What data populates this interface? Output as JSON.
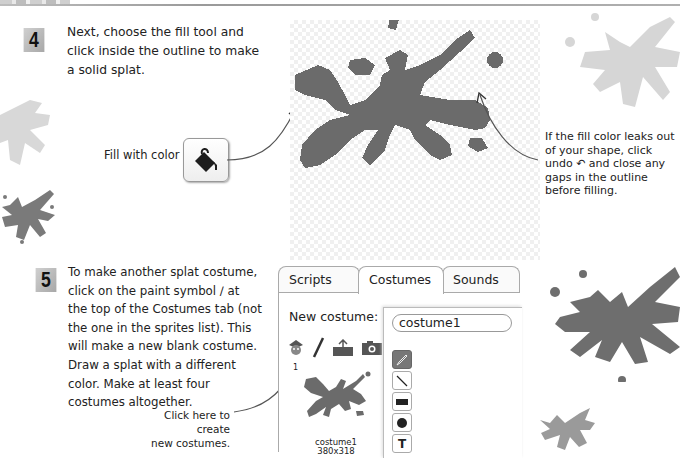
{
  "step4": {
    "number": "4",
    "text_lines": [
      "Next, choose the fill tool and",
      "click inside the outline to make",
      "a solid splat."
    ],
    "fill_label": "Fill with color",
    "note_lines": [
      "If the fill color leaks out",
      "of your shape, click",
      "undo ↶ and close any",
      "gaps in the outline",
      "before filling."
    ]
  },
  "step5": {
    "number": "5",
    "text_lines": [
      "To make another splat costume,",
      "click on the paint symbol ∕ at",
      "the top of the Costumes tab (not",
      "the one in the sprites list). This",
      "will make a new blank costume.",
      "Draw a splat with a different",
      "color. Make at least four",
      "costumes altogether."
    ],
    "caption_lines": [
      "Click here to create",
      "new costumes."
    ]
  },
  "scratch_ui": {
    "tabs": [
      {
        "label": "Scripts",
        "active": false
      },
      {
        "label": "Costumes",
        "active": true
      },
      {
        "label": "Sounds",
        "active": false
      }
    ],
    "new_costume_label": "New costume:",
    "costume_index": "1",
    "costume_name": "costume1",
    "costume_size": "380x318",
    "name_field_value": "costume1",
    "tools": [
      "brush",
      "line",
      "rectangle",
      "ellipse",
      "text"
    ],
    "tool_text_glyph": "T"
  },
  "colors": {
    "splat": "#6b6b6b",
    "splat_light": "#d6d6d6",
    "splat_mid": "#8a8a8a"
  }
}
